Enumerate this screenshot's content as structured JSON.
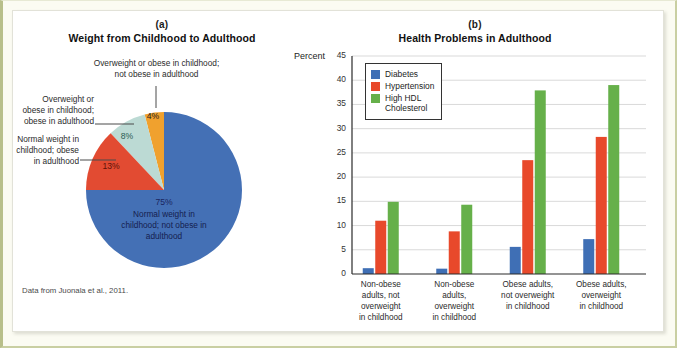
{
  "figure": {
    "source_note": "Data from Juonala et al., 2011."
  },
  "panel_a": {
    "letter": "(a)",
    "title": "Weight from Childhood to Adulthood",
    "callouts": {
      "top": "Overweight or obese in childhood;\nnot obese in adulthood",
      "upper_left": "Overweight or\nobese in childhood;\nobese in adulthood",
      "lower_left": "Normal weight in\nchildhood; obese\nin adulthood"
    },
    "slice_labels": {
      "blue_pct": "75%",
      "blue_text": "Normal weight in\nchildhood; not obese in\nadulthood",
      "red_pct": "13%",
      "teal_pct": "8%",
      "orange_pct": "4%"
    }
  },
  "panel_b": {
    "letter": "(b)",
    "title": "Health Problems in Adulthood",
    "axis_label": "Percent"
  },
  "chart_data": [
    {
      "type": "pie",
      "title": "Weight from Childhood to Adulthood",
      "labels": [
        "Normal weight in childhood; not obese in adulthood",
        "Overweight or obese in childhood; not obese in adulthood",
        "Overweight or obese in childhood; obese in adulthood",
        "Normal weight in childhood; obese in adulthood"
      ],
      "values": [
        75,
        4,
        8,
        13
      ],
      "display_values": [
        "75%",
        "4%",
        "8%",
        "13%"
      ],
      "colors": [
        "#4470b5",
        "#f0a12e",
        "#bcdad4",
        "#e24b32"
      ],
      "legend": "none"
    },
    {
      "type": "bar",
      "title": "Health Problems in Adulthood",
      "xlabel": "",
      "ylabel": "Percent",
      "ylim": [
        0,
        45
      ],
      "yticks": [
        0,
        5,
        10,
        15,
        20,
        25,
        30,
        35,
        40,
        45
      ],
      "grid": true,
      "legend_position": "upper-left",
      "categories": [
        "Non-obese adults, not overweight in childhood",
        "Non-obese adults, overweight in childhood",
        "Obese adults, not overweight in childhood",
        "Obese adults, overweight in childhood"
      ],
      "category_lines": [
        [
          "Non-obese",
          "adults, not",
          "overweight",
          "in childhood"
        ],
        [
          "Non-obese",
          "adults,",
          "overweight",
          "in childhood"
        ],
        [
          "Obese adults,",
          "not overweight",
          "in childhood"
        ],
        [
          "Obese adults,",
          "overweight",
          "in childhood"
        ]
      ],
      "series": [
        {
          "name": "Diabetes",
          "color": "#3f6fb5",
          "values": [
            1.2,
            1.1,
            5.6,
            7.2
          ]
        },
        {
          "name": "Hypertension",
          "color": "#e8492b",
          "values": [
            11.0,
            8.8,
            23.5,
            28.3
          ]
        },
        {
          "name": "High HDL\nCholesterol",
          "color": "#66b04a",
          "values": [
            14.9,
            14.3,
            37.9,
            39.0
          ]
        }
      ]
    }
  ]
}
